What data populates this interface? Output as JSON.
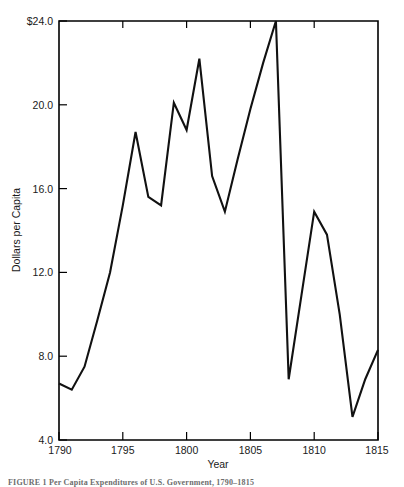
{
  "figure": {
    "caption": "FIGURE 1   Per Capita Expenditures of U.S. Government, 1790–1815"
  },
  "chart_data": {
    "type": "line",
    "title": "",
    "subtitle": "",
    "xlabel": "Year",
    "ylabel": "Dollars per Capita",
    "xlim": [
      1790,
      1815
    ],
    "ylim": [
      4.0,
      24.0
    ],
    "grid": false,
    "legend": "none",
    "x_ticks": [
      1790,
      1795,
      1800,
      1805,
      1810,
      1815
    ],
    "x_tick_labels": [
      "1790",
      "1795",
      "1800",
      "1805",
      "1810",
      "1815"
    ],
    "y_ticks": [
      4.0,
      8.0,
      12.0,
      16.0,
      20.0,
      24.0
    ],
    "y_tick_labels": [
      "4.0",
      "8.0",
      "12.0",
      "16.0",
      "20.0",
      "$24.0"
    ],
    "series": [
      {
        "name": "Dollars per Capita",
        "color": "#111111",
        "x": [
          1790,
          1791,
          1792,
          1793,
          1794,
          1795,
          1796,
          1797,
          1798,
          1799,
          1800,
          1801,
          1802,
          1803,
          1804,
          1805,
          1806,
          1807,
          1808,
          1809,
          1810,
          1811,
          1812,
          1813,
          1814,
          1815
        ],
        "values": [
          6.7,
          6.4,
          7.5,
          9.7,
          12.0,
          15.2,
          18.7,
          15.6,
          15.2,
          20.1,
          18.8,
          22.2,
          16.6,
          14.9,
          17.4,
          19.8,
          22.0,
          24.0,
          6.9,
          10.9,
          14.9,
          13.8,
          10.0,
          5.1,
          6.9,
          8.3
        ]
      }
    ]
  }
}
